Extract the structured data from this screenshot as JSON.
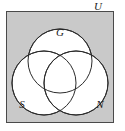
{
  "figure": {
    "kind": "venn-diagram",
    "colors": {
      "universe_fill": "#c9c9c9",
      "universe_border": "#4a4a4a",
      "circle_fill": "#ffffff",
      "circle_stroke": "#2b2b2b",
      "label_color": "#1a1a1a",
      "page_background": "#ffffff"
    },
    "universe": {
      "label": "U",
      "label_position": "outside-top-right",
      "rect": {
        "x": 6,
        "y": 11,
        "width": 108,
        "height": 112
      }
    },
    "sets": [
      {
        "id": "set-g",
        "label": "G",
        "label_position": "top",
        "circle": {
          "cx": 60,
          "cy": 61,
          "r": 32
        },
        "label_point": {
          "x": 60,
          "y": 35
        }
      },
      {
        "id": "set-s",
        "label": "S",
        "label_position": "bottom-left",
        "circle": {
          "cx": 44,
          "cy": 83,
          "r": 32
        },
        "label_point": {
          "x": 22,
          "y": 107
        }
      },
      {
        "id": "set-n",
        "label": "N",
        "label_position": "bottom-right",
        "circle": {
          "cx": 76,
          "cy": 83,
          "r": 32
        },
        "label_point": {
          "x": 99,
          "y": 107
        }
      }
    ],
    "universe_label_point": {
      "x": 98,
      "y": 10
    }
  }
}
